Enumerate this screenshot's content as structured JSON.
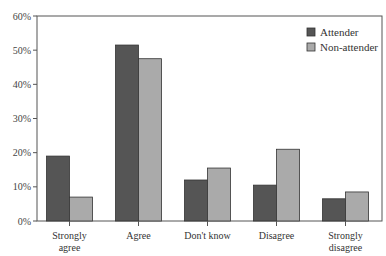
{
  "chart_data": {
    "type": "bar",
    "title": "",
    "xlabel": "",
    "ylabel": "",
    "ylim": [
      0,
      60
    ],
    "yticks": [
      "0%",
      "10%",
      "20%",
      "30%",
      "40%",
      "50%",
      "60%"
    ],
    "categories": [
      "Strongly agree",
      "Agree",
      "Don't know",
      "Disagree",
      "Strongly disagree"
    ],
    "category_lines": [
      [
        "Strongly",
        "agree"
      ],
      [
        "Agree"
      ],
      [
        "Don't know"
      ],
      [
        "Disagree"
      ],
      [
        "Strongly",
        "disagree"
      ]
    ],
    "series": [
      {
        "name": "Attender",
        "color": "#555555",
        "values": [
          19,
          51.5,
          12,
          10.5,
          6.5
        ]
      },
      {
        "name": "Non-attender",
        "color": "#aaaaaa",
        "values": [
          7,
          47.5,
          15.5,
          21,
          8.5
        ]
      }
    ],
    "legend_position": "top-right",
    "grid": false
  }
}
